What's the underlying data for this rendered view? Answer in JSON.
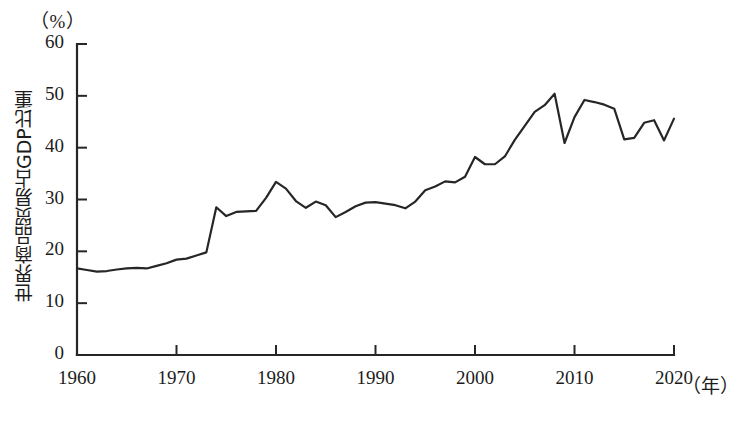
{
  "figure": {
    "unit_label": "（%）",
    "y_axis_title": "世界商品贸易占GDP比重",
    "x_unit_label": "（年）"
  },
  "chart_data": {
    "type": "line",
    "title": "",
    "subtitle": "",
    "xlabel": "（年）",
    "ylabel": "世界商品贸易占GDP比重",
    "unit": "%",
    "xlim": [
      1960,
      2020
    ],
    "ylim": [
      0,
      60
    ],
    "xticks": [
      1960,
      1970,
      1980,
      1990,
      2000,
      2010,
      2020
    ],
    "yticks": [
      0,
      10,
      20,
      30,
      40,
      50,
      60
    ],
    "xtick_labels": [
      "1960",
      "1970",
      "1980",
      "1990",
      "2000",
      "2010",
      "2020"
    ],
    "ytick_labels": [
      "0",
      "10",
      "20",
      "30",
      "40",
      "50",
      "60"
    ],
    "grid": false,
    "legend": null,
    "legend_position": "none",
    "line_color": "#262626",
    "line_width": 2.2,
    "markers": false,
    "series": [
      {
        "name": "世界商品贸易占GDP比重",
        "x": [
          1960,
          1961,
          1962,
          1963,
          1964,
          1965,
          1966,
          1967,
          1968,
          1969,
          1970,
          1971,
          1972,
          1973,
          1974,
          1975,
          1976,
          1977,
          1978,
          1979,
          1980,
          1981,
          1982,
          1983,
          1984,
          1985,
          1986,
          1987,
          1988,
          1989,
          1990,
          1991,
          1992,
          1993,
          1994,
          1995,
          1996,
          1997,
          1998,
          1999,
          2000,
          2001,
          2002,
          2003,
          2004,
          2005,
          2006,
          2007,
          2008,
          2009,
          2010,
          2011,
          2012,
          2013,
          2014,
          2015,
          2016,
          2017,
          2018,
          2019,
          2020
        ],
        "values": [
          16.7,
          16.4,
          16.1,
          16.2,
          16.5,
          16.7,
          16.8,
          16.7,
          17.2,
          17.7,
          18.4,
          18.6,
          19.2,
          19.8,
          28.5,
          26.8,
          27.6,
          27.7,
          27.8,
          30.3,
          33.4,
          32.1,
          29.7,
          28.4,
          29.6,
          28.9,
          26.6,
          27.6,
          28.7,
          29.4,
          29.5,
          29.2,
          28.9,
          28.3,
          29.6,
          31.8,
          32.5,
          33.5,
          33.3,
          34.4,
          38.2,
          36.8,
          36.8,
          38.3,
          41.5,
          44.2,
          46.9,
          48.2,
          50.4,
          40.9,
          45.9,
          49.2,
          48.8,
          48.3,
          47.5,
          41.6,
          41.9,
          44.8,
          45.3,
          41.4,
          45.6
        ]
      }
    ],
    "annotations": [],
    "notable_points": [
      {
        "year": 1974,
        "value": 28.5,
        "note": "oil-crisis jump"
      },
      {
        "year": 1980,
        "value": 33.4,
        "note": "local peak"
      },
      {
        "year": 1986,
        "value": 26.6,
        "note": "local trough"
      },
      {
        "year": 2008,
        "value": 50.4,
        "note": "maximum"
      },
      {
        "year": 2009,
        "value": 40.9,
        "note": "financial-crisis drop"
      },
      {
        "year": 2011,
        "value": 49.2,
        "note": "post-crisis rebound"
      },
      {
        "year": 2020,
        "value": 45.6,
        "note": "final value"
      }
    ]
  }
}
